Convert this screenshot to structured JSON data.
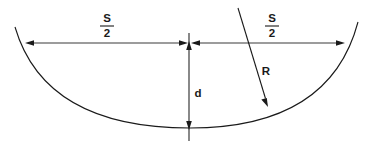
{
  "diagram": {
    "background_color": "#ffffff",
    "line_color": "#1a1a1a",
    "dimension_color": "#3a3a3a",
    "width": 369,
    "height": 148,
    "labels": {
      "half_chord_left": {
        "numerator": "S",
        "denominator": "2"
      },
      "half_chord_right": {
        "numerator": "S",
        "denominator": "2"
      },
      "depth": "d",
      "radius": "R"
    },
    "geometry": {
      "chord_line": {
        "x1": 25,
        "y1": 43,
        "x2": 345,
        "y2": 43
      },
      "center_point": {
        "x": 189,
        "y": 43
      },
      "arc_low_point": {
        "x": 190,
        "y": 128
      },
      "arc_start": {
        "x": 15,
        "y": 27
      },
      "arc_end": {
        "x": 358,
        "y": 22
      },
      "vertical_line": {
        "x": 189,
        "y_top": 33,
        "y_bottom": 141
      },
      "radius_line": {
        "x1": 238,
        "y1": 8,
        "x2": 268,
        "y2": 107
      }
    },
    "label_positions": {
      "half_chord_left": {
        "x": 107,
        "y": 24
      },
      "half_chord_right": {
        "x": 272,
        "y": 24
      },
      "depth": {
        "x": 198,
        "y": 93
      },
      "radius": {
        "x": 265,
        "y": 71
      }
    }
  }
}
